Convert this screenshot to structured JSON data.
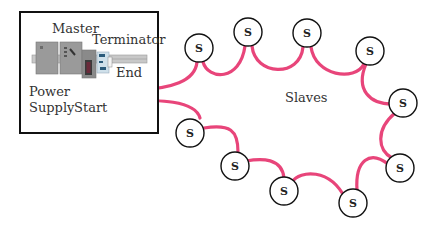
{
  "diagram": {
    "type": "network-topology-daisy-chain",
    "colors": {
      "cable": "#e8457a",
      "outline": "#111111",
      "device_gray": "#9a9a9a",
      "device_dark": "#7f7f7f",
      "rail": "#c8c8c8",
      "terminator": "#cfe0ea"
    },
    "cabinet": {
      "labels": {
        "master": "Master",
        "terminator": "Terminator",
        "end": "End",
        "power": "Power",
        "supply": "Supply",
        "start": "Start"
      }
    },
    "slaves_label": "Slaves",
    "slave_glyph": "S",
    "slaves": [
      {
        "id": 1,
        "label": "S"
      },
      {
        "id": 2,
        "label": "S"
      },
      {
        "id": 3,
        "label": "S"
      },
      {
        "id": 4,
        "label": "S"
      },
      {
        "id": 5,
        "label": "S"
      },
      {
        "id": 6,
        "label": "S"
      },
      {
        "id": 7,
        "label": "S"
      },
      {
        "id": 8,
        "label": "S"
      },
      {
        "id": 9,
        "label": "S"
      },
      {
        "id": 10,
        "label": "S"
      },
      {
        "id": 11,
        "label": "S"
      }
    ]
  }
}
